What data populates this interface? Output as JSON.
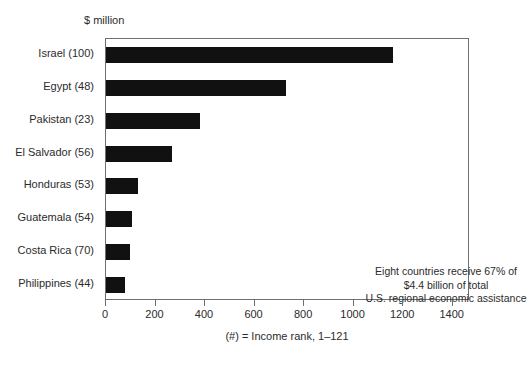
{
  "chart_data": {
    "type": "bar",
    "orientation": "horizontal",
    "title": "",
    "unit_label": "$ million",
    "xlabel": "",
    "ylabel": "",
    "categories": [
      "Israel (100)",
      "Egypt (48)",
      "Pakistan (23)",
      "El Salvador (56)",
      "Honduras (53)",
      "Guatemala (54)",
      "Costa Rica (70)",
      "Philippines (44)"
    ],
    "values": [
      1160,
      725,
      380,
      265,
      130,
      105,
      98,
      75
    ],
    "xlim": [
      0,
      1470
    ],
    "xticks": [
      0,
      200,
      400,
      600,
      800,
      1000,
      1200,
      1400
    ],
    "xtick_labels": [
      "0",
      "200",
      "400",
      "600",
      "800",
      "1000",
      "1200",
      "1400"
    ],
    "grid": false,
    "legend": null,
    "bar_color": "#111111",
    "frame_color": "#6f6f6f",
    "annotation_lines": [
      "Eight countries receive 67% of",
      "$4.4 billion of total",
      "U.S. regional economic assistance"
    ],
    "footnote": "(#) = Income rank, 1–121"
  }
}
